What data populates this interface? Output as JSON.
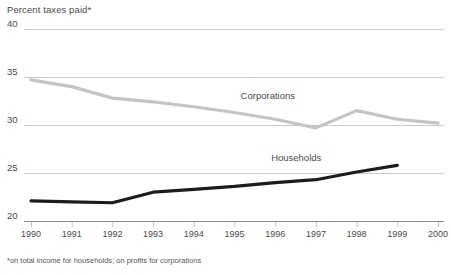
{
  "chart_data": {
    "type": "line",
    "title": "Percent taxes paid*",
    "xlabel": "",
    "ylabel": "",
    "footnote": "*on total income for households; on profits for corporations",
    "grid": true,
    "legend_position": "inline-annotation",
    "categories": [
      "1990",
      "1991",
      "1992",
      "1993",
      "1994",
      "1995",
      "1996",
      "1997",
      "1998",
      "1999",
      "2000"
    ],
    "x": [
      1990,
      1991,
      1992,
      1993,
      1994,
      1995,
      1996,
      1997,
      1998,
      1999,
      2000
    ],
    "ylim": [
      20,
      40
    ],
    "yticks": [
      20,
      25,
      30,
      35,
      40
    ],
    "ytick_labels": [
      "20",
      "25",
      "30",
      "35",
      "40"
    ],
    "series": [
      {
        "name": "Corporations",
        "color": "#c4c4c4",
        "values": [
          34.7,
          34.0,
          32.8,
          32.4,
          31.9,
          31.3,
          30.6,
          29.7,
          31.5,
          30.6,
          30.2
        ],
        "label_x": 1995.15,
        "label_y": 32.9
      },
      {
        "name": "Households",
        "color": "#1c1c1c",
        "values": [
          22.1,
          22.0,
          21.9,
          23.0,
          23.3,
          23.6,
          24.0,
          24.3,
          25.1,
          25.8,
          null
        ],
        "label_x": 1995.9,
        "label_y": 26.5
      }
    ]
  }
}
